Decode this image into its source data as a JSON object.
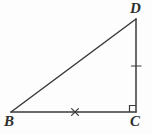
{
  "figure": {
    "kind": "geometry-diagram",
    "shape": "right-triangle",
    "name": "Triangle BCD",
    "background_color": "#fdfdfd",
    "stroke_color": "#3a3a3a",
    "stroke_width": 1.4,
    "width": 152,
    "height": 134,
    "vertices": [
      {
        "id": "B",
        "label": "B",
        "x": 11,
        "y": 112,
        "label_x": 4,
        "label_y": 114
      },
      {
        "id": "C",
        "label": "C",
        "x": 136,
        "y": 112,
        "label_x": 130,
        "label_y": 114
      },
      {
        "id": "D",
        "label": "D",
        "x": 136,
        "y": 19,
        "label_x": 130,
        "label_y": 1
      }
    ],
    "sides": [
      {
        "id": "BC",
        "from": "B",
        "to": "C",
        "role": "base",
        "x1": 11,
        "y1": 112,
        "x2": 136,
        "y2": 112
      },
      {
        "id": "CD",
        "from": "C",
        "to": "D",
        "role": "leg",
        "x1": 136,
        "y1": 112,
        "x2": 136,
        "y2": 19
      },
      {
        "id": "DB",
        "from": "D",
        "to": "B",
        "role": "hypotenuse",
        "x1": 136,
        "y1": 19,
        "x2": 11,
        "y2": 112
      }
    ],
    "marks": [
      {
        "id": "right-angle-C",
        "type": "right-angle-square",
        "at_vertex": "C",
        "x": 129.5,
        "y": 105.5,
        "size": 6.5
      },
      {
        "id": "tick-CD",
        "type": "single-tick",
        "on_side": "CD",
        "cx": 136,
        "cy": 66,
        "x1": 131,
        "y1": 66,
        "x2": 141,
        "y2": 66
      },
      {
        "id": "cross-BC",
        "type": "x-mark",
        "on_side": "BC",
        "cx": 75,
        "cy": 112,
        "arm": 3.6
      }
    ]
  }
}
